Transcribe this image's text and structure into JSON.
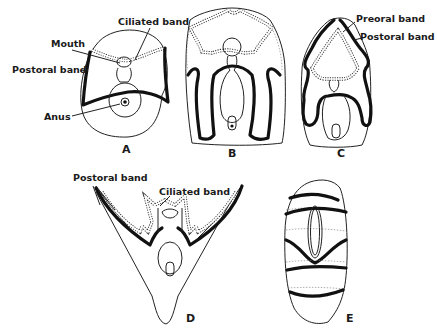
{
  "figure": {
    "panels": [
      {
        "id": "A",
        "label": "A",
        "annotations": [
          "Ciliated band",
          "Mouth",
          "Postoral band",
          "Anus"
        ]
      },
      {
        "id": "B",
        "label": "B",
        "annotations": []
      },
      {
        "id": "C",
        "label": "C",
        "annotations": [
          "Preoral band",
          "Postoral band"
        ]
      },
      {
        "id": "D",
        "label": "D",
        "annotations": [
          "Postoral band",
          "Ciliated band"
        ]
      },
      {
        "id": "E",
        "label": "E",
        "annotations": []
      }
    ]
  },
  "labels": {
    "a_ciliated_band": "Ciliated band",
    "a_mouth": "Mouth",
    "a_postoral_band": "Postoral band",
    "a_anus": "Anus",
    "c_preoral_band": "Preoral band",
    "c_postoral_band": "Postoral band",
    "d_postoral_band": "Postoral band",
    "d_ciliated_band": "Ciliated band"
  },
  "colors": {
    "ink": "#111111",
    "background": "#ffffff"
  }
}
